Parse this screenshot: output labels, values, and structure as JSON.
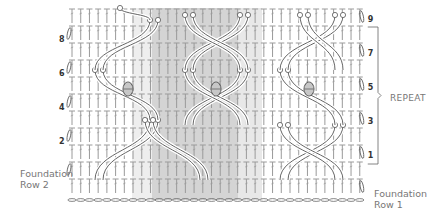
{
  "diagram": {
    "type": "crochet-stitch-chart",
    "grid": {
      "x0": 72,
      "stitch_pitch": 8.72,
      "stitches": 34,
      "row_tops": [
        8,
        25,
        42,
        59,
        76,
        93,
        110,
        127,
        144,
        161,
        178
      ],
      "row_height": 17,
      "chain_y": 200
    },
    "shading": [
      {
        "x": 152,
        "width": 86,
        "color": "#d4d4d4"
      },
      {
        "x": 238,
        "width": 24,
        "color": "#e8e8e8"
      },
      {
        "x": 132,
        "width": 20,
        "color": "#eeeeee"
      }
    ],
    "colors": {
      "stitch": "#9a9a9a",
      "stitch_dark": "#555555",
      "bracket": "#666666",
      "label": "#777777"
    },
    "bobbles": [
      {
        "x": 128,
        "y": 89
      },
      {
        "x": 216,
        "y": 89
      },
      {
        "x": 309,
        "y": 89
      }
    ],
    "cables": [
      {
        "from": [
          95,
          180
        ],
        "to": [
          150,
          120
        ]
      },
      {
        "from": [
          103,
          180
        ],
        "to": [
          158,
          120
        ]
      },
      {
        "from": [
          150,
          120
        ],
        "to": [
          95,
          70
        ]
      },
      {
        "from": [
          158,
          120
        ],
        "to": [
          103,
          70
        ]
      },
      {
        "from": [
          95,
          70
        ],
        "to": [
          150,
          20
        ]
      },
      {
        "from": [
          103,
          70
        ],
        "to": [
          158,
          20
        ]
      },
      {
        "from": [
          200,
          180
        ],
        "to": [
          145,
          120
        ]
      },
      {
        "from": [
          208,
          180
        ],
        "to": [
          153,
          120
        ]
      },
      {
        "from": [
          185,
          125
        ],
        "to": [
          240,
          70
        ]
      },
      {
        "from": [
          193,
          125
        ],
        "to": [
          248,
          70
        ]
      },
      {
        "from": [
          240,
          125
        ],
        "to": [
          185,
          70
        ]
      },
      {
        "from": [
          248,
          125
        ],
        "to": [
          193,
          70
        ]
      },
      {
        "from": [
          185,
          70
        ],
        "to": [
          240,
          15
        ]
      },
      {
        "from": [
          193,
          70
        ],
        "to": [
          248,
          15
        ]
      },
      {
        "from": [
          240,
          70
        ],
        "to": [
          185,
          15
        ]
      },
      {
        "from": [
          248,
          70
        ],
        "to": [
          193,
          15
        ]
      },
      {
        "from": [
          280,
          180
        ],
        "to": [
          335,
          125
        ]
      },
      {
        "from": [
          288,
          180
        ],
        "to": [
          343,
          125
        ]
      },
      {
        "from": [
          335,
          125
        ],
        "to": [
          280,
          70
        ]
      },
      {
        "from": [
          343,
          125
        ],
        "to": [
          288,
          70
        ]
      },
      {
        "from": [
          280,
          70
        ],
        "to": [
          335,
          15
        ]
      },
      {
        "from": [
          288,
          70
        ],
        "to": [
          343,
          15
        ]
      },
      {
        "from": [
          335,
          180
        ],
        "to": [
          280,
          125
        ]
      },
      {
        "from": [
          343,
          180
        ],
        "to": [
          288,
          125
        ]
      },
      {
        "from": [
          150,
          20
        ],
        "to": [
          120,
          8
        ]
      },
      {
        "from": [
          335,
          70
        ],
        "to": [
          300,
          15
        ]
      },
      {
        "from": [
          343,
          70
        ],
        "to": [
          308,
          15
        ]
      }
    ],
    "row_labels_left": [
      {
        "text": "8",
        "y": 40
      },
      {
        "text": "6",
        "y": 74
      },
      {
        "text": "4",
        "y": 108
      },
      {
        "text": "2",
        "y": 142
      }
    ],
    "row_labels_right": [
      {
        "text": "9",
        "y": 20
      },
      {
        "text": "7",
        "y": 54
      },
      {
        "text": "5",
        "y": 88
      },
      {
        "text": "3",
        "y": 122
      },
      {
        "text": "1",
        "y": 156
      }
    ],
    "repeat_bracket": {
      "x": 378,
      "y_top": 27,
      "y_bottom": 164,
      "label": "REPEAT"
    },
    "labels": {
      "foundation_row_2": [
        "Foundation",
        "Row 2"
      ],
      "foundation_row_1": [
        "Foundation",
        "Row 1"
      ],
      "repeat": "REPEAT"
    }
  }
}
